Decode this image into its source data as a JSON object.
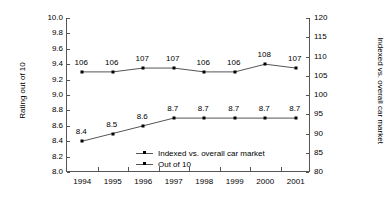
{
  "chart_data": {
    "type": "line",
    "title": "",
    "xlabel": "",
    "ylabel": "Rating out of 10",
    "y2label": "Indexed vs. overall car market",
    "categories": [
      "1994",
      "1995",
      "1996",
      "1997",
      "1998",
      "1999",
      "2000",
      "2001"
    ],
    "ylim": [
      8.0,
      10.0
    ],
    "y2lim": [
      80,
      120
    ],
    "yticks": [
      "10.0",
      "9.8",
      "9.6",
      "9.4",
      "9.2",
      "9.0",
      "8.8",
      "8.6",
      "8.4",
      "8.2",
      "8.0"
    ],
    "ytick_values": [
      10.0,
      9.8,
      9.6,
      9.4,
      9.2,
      9.0,
      8.8,
      8.6,
      8.4,
      8.2,
      8.0
    ],
    "y2ticks": [
      "120",
      "115",
      "110",
      "105",
      "100",
      "95",
      "90",
      "85",
      "80"
    ],
    "y2tick_values": [
      120,
      115,
      110,
      105,
      100,
      95,
      90,
      85,
      80
    ],
    "grid": false,
    "legend_position": "inside-bottom-center",
    "series": [
      {
        "name": "Indexed vs. overall car market",
        "axis": "right",
        "values": [
          106,
          106,
          107,
          107,
          106,
          106,
          108,
          107
        ],
        "labels": [
          "106",
          "106",
          "107",
          "107",
          "106",
          "106",
          "108",
          "107"
        ],
        "marker": "square",
        "color": "#000000",
        "line_color": "#555555"
      },
      {
        "name": "Out of 10",
        "axis": "left",
        "values": [
          8.4,
          8.5,
          8.6,
          8.7,
          8.7,
          8.7,
          8.7,
          8.7
        ],
        "labels": [
          "8.4",
          "8.5",
          "8.6",
          "8.7",
          "8.7",
          "8.7",
          "8.7",
          "8.7"
        ],
        "marker": "square",
        "color": "#000000",
        "line_color": "#555555"
      }
    ],
    "legend": [
      "Indexed vs. overall car market",
      "Out of 10"
    ],
    "axis_color": "#555555",
    "background": "#ffffff"
  }
}
